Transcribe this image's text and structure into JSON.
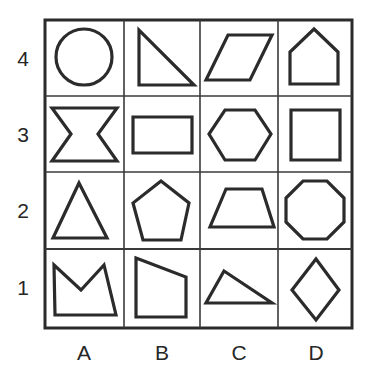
{
  "figure": {
    "background_color": "#ffffff",
    "ink_color": "#2b2b2b",
    "grid": {
      "columns": 4,
      "rows": 4,
      "left": 45,
      "top": 20,
      "right": 352,
      "bottom": 328,
      "vertical_dividers": [
        124,
        200,
        278
      ],
      "horizontal_dividers": [
        96,
        172,
        249
      ],
      "outer_border_width": 3,
      "inner_line_width": 1.5
    },
    "column_labels": [
      "A",
      "B",
      "C",
      "D"
    ],
    "row_labels": [
      "4",
      "3",
      "2",
      "1"
    ],
    "cells": [
      {
        "id": "A4",
        "column": "A",
        "row": "4",
        "shape": "circle"
      },
      {
        "id": "B4",
        "column": "B",
        "row": "4",
        "shape": "right-triangle"
      },
      {
        "id": "C4",
        "column": "C",
        "row": "4",
        "shape": "parallelogram"
      },
      {
        "id": "D4",
        "column": "D",
        "row": "4",
        "shape": "house-pentagon"
      },
      {
        "id": "A3",
        "column": "A",
        "row": "3",
        "shape": "concave-hexagon-bowtie"
      },
      {
        "id": "B3",
        "column": "B",
        "row": "3",
        "shape": "rectangle"
      },
      {
        "id": "C3",
        "column": "C",
        "row": "3",
        "shape": "hexagon"
      },
      {
        "id": "D3",
        "column": "D",
        "row": "3",
        "shape": "square"
      },
      {
        "id": "A2",
        "column": "A",
        "row": "2",
        "shape": "isosceles-triangle"
      },
      {
        "id": "B2",
        "column": "B",
        "row": "2",
        "shape": "pentagon"
      },
      {
        "id": "C2",
        "column": "C",
        "row": "2",
        "shape": "trapezoid"
      },
      {
        "id": "D2",
        "column": "D",
        "row": "2",
        "shape": "octagon"
      },
      {
        "id": "A1",
        "column": "A",
        "row": "1",
        "shape": "concave-crown-quadrilateral"
      },
      {
        "id": "B1",
        "column": "B",
        "row": "1",
        "shape": "irregular-quadrilateral"
      },
      {
        "id": "C1",
        "column": "C",
        "row": "1",
        "shape": "scalene-triangle"
      },
      {
        "id": "D1",
        "column": "D",
        "row": "1",
        "shape": "rhombus-diamond"
      }
    ]
  }
}
